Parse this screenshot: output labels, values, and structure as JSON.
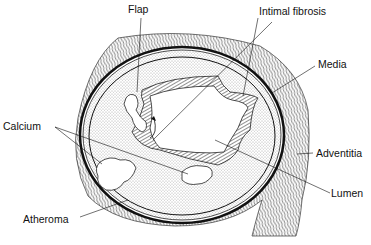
{
  "diagram": {
    "labels": {
      "flap": "Flap",
      "intimal_fibrosis": "Intimal fibrosis",
      "media": "Media",
      "calcium": "Calcium",
      "adventitia": "Adventitia",
      "lumen": "Lumen",
      "atheroma": "Atheroma"
    }
  }
}
